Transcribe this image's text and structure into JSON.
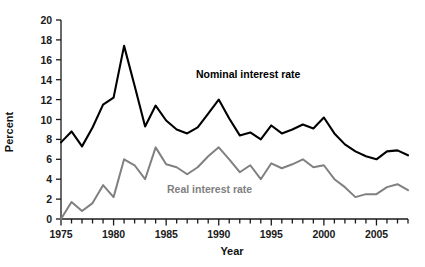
{
  "chart_data": {
    "type": "line",
    "title": "",
    "xlabel": "Year",
    "ylabel": "Percent",
    "xlim": [
      1975,
      2008
    ],
    "ylim": [
      0,
      20
    ],
    "grid": false,
    "legend_position": "inline-annotations",
    "x_tick_labels": [
      "1975",
      "1980",
      "1985",
      "1990",
      "1995",
      "2000",
      "2005"
    ],
    "x_tick_values": [
      1975,
      1980,
      1985,
      1990,
      1995,
      2000,
      2005
    ],
    "x_minor_tick_step": 1,
    "y_tick_labels": [
      "0",
      "2",
      "4",
      "6",
      "8",
      "10",
      "12",
      "14",
      "16",
      "18",
      "20"
    ],
    "y_tick_values": [
      0,
      2,
      4,
      6,
      8,
      10,
      12,
      14,
      16,
      18,
      20
    ],
    "x": [
      1975,
      1976,
      1977,
      1978,
      1979,
      1980,
      1981,
      1982,
      1983,
      1984,
      1985,
      1986,
      1987,
      1988,
      1989,
      1990,
      1991,
      1992,
      1993,
      1994,
      1995,
      1996,
      1997,
      1998,
      1999,
      2000,
      2001,
      2002,
      2003,
      2004,
      2005,
      2006,
      2007,
      2008
    ],
    "series": [
      {
        "name": "Nominal interest rate",
        "color": "#000000",
        "annotation": "Nominal interest rate",
        "values": [
          7.7,
          8.8,
          7.3,
          9.2,
          11.5,
          12.2,
          17.4,
          13.4,
          9.3,
          11.4,
          9.9,
          9.0,
          8.6,
          9.2,
          10.6,
          12.0,
          10.1,
          8.4,
          8.7,
          8.0,
          9.4,
          8.6,
          9.0,
          9.5,
          9.1,
          10.2,
          8.6,
          7.5,
          6.8,
          6.3,
          6.0,
          6.8,
          6.9,
          6.4
        ]
      },
      {
        "name": "Real interest rate",
        "color": "#808080",
        "annotation": "Real interest rate",
        "values": [
          0.0,
          1.7,
          0.8,
          1.6,
          3.4,
          2.2,
          6.0,
          5.4,
          4.0,
          7.2,
          5.5,
          5.2,
          4.5,
          5.2,
          6.3,
          7.2,
          6.0,
          4.7,
          5.4,
          4.0,
          5.6,
          5.1,
          5.5,
          6.0,
          5.2,
          5.4,
          4.0,
          3.2,
          2.2,
          2.5,
          2.5,
          3.2,
          3.5,
          2.9
        ]
      }
    ],
    "geometry": {
      "plot_left": 61,
      "plot_right": 408,
      "plot_top": 20,
      "plot_bottom": 219,
      "axis_color": "#1a1a1a",
      "nominal_stroke_width": 2.1,
      "real_stroke_width": 2.0
    }
  }
}
